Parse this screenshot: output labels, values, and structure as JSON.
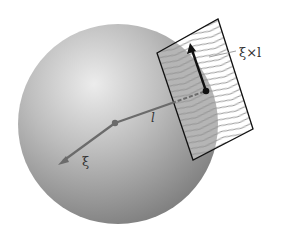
{
  "figure": {
    "labels": {
      "cross_product": "ξ×l",
      "radius": "l",
      "xi": "ξ"
    },
    "colors": {
      "background": "#ffffff",
      "sphere_light": "#e4e4e4",
      "sphere_dark": "#7a7a7a",
      "vector_gray": "#6b6b6b",
      "plane_outline": "#111111",
      "arrow_black": "#111111"
    },
    "geometry": {
      "sphere_center": [
        118,
        124
      ],
      "sphere_radius": 100,
      "plane_corners": [
        [
          157,
          53
        ],
        [
          218,
          19
        ],
        [
          253,
          129
        ],
        [
          193,
          160
        ]
      ],
      "contact_point": [
        206,
        91
      ],
      "origin_point": [
        115,
        123
      ],
      "xi_tip": [
        58,
        165
      ],
      "cross_tip": [
        190,
        43
      ]
    }
  }
}
